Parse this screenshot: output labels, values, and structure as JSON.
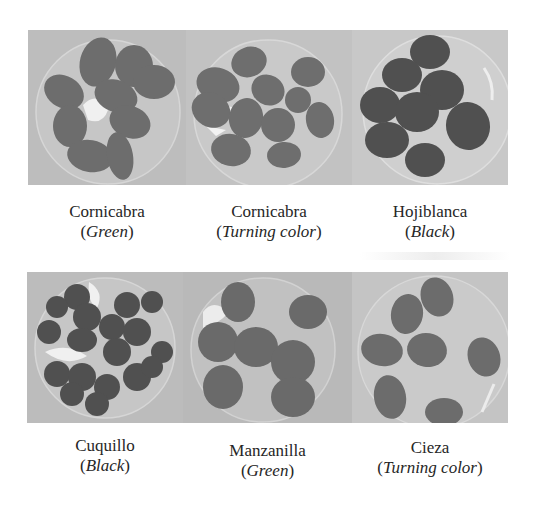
{
  "figure": {
    "rows": [
      {
        "panels": [
          {
            "variety": "Cornicabra",
            "stage": "Green",
            "tone": "medium"
          },
          {
            "variety": "Cornicabra",
            "stage": "Turning color",
            "tone": "medium"
          },
          {
            "variety": "Hojiblanca",
            "stage": "Black",
            "tone": "dark"
          }
        ]
      },
      {
        "panels": [
          {
            "variety": "Cuquillo",
            "stage": "Black",
            "tone": "dark"
          },
          {
            "variety": "Manzanilla",
            "stage": "Green",
            "tone": "medium"
          },
          {
            "variety": "Cieza",
            "stage": "Turning color",
            "tone": "medium"
          }
        ]
      }
    ],
    "colors": {
      "background": "#ffffff",
      "photo_background": "#bcbcbc",
      "dish_highlight": "#e8e8e8",
      "olive_medium": "#6b6b6b",
      "olive_dark": "#4e4e4e",
      "text": "#262626"
    }
  }
}
